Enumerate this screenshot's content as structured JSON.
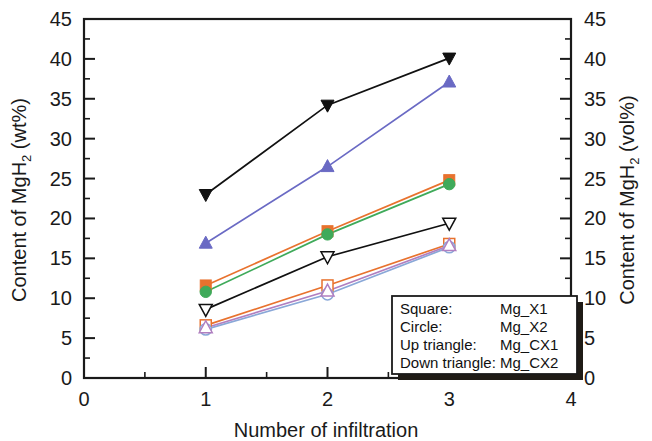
{
  "chart_data": {
    "type": "line",
    "title": "",
    "xlabel": "Number of infiltration",
    "ylabel": "Content of MgH2 (wt%)",
    "ylabel_right": "Content of MgH2 (vol%)",
    "ylabel_main_text": "Content of MgH",
    "ylabel_sub": "2",
    "ylabel_unit": " (wt%)",
    "ylabel_right_main_text": "Content of MgH",
    "ylabel_right_sub": "2",
    "ylabel_right_unit": " (vol%)",
    "x": [
      1,
      2,
      3
    ],
    "xlim": [
      0,
      4
    ],
    "ylim": [
      0,
      45
    ],
    "xticks": [
      0,
      1,
      2,
      3,
      4
    ],
    "yticks": [
      0,
      5,
      10,
      15,
      20,
      25,
      30,
      35,
      40,
      45
    ],
    "yticks_right": [
      0,
      5,
      10,
      15,
      20,
      25,
      30,
      35,
      40,
      45
    ],
    "xtick_labels": [
      "0",
      "1",
      "2",
      "3",
      "4"
    ],
    "ytick_labels": [
      "0",
      "5",
      "10",
      "15",
      "20",
      "25",
      "30",
      "35",
      "40",
      "45"
    ],
    "ytick_labels_right": [
      "0",
      "5",
      "10",
      "15",
      "20",
      "25",
      "30",
      "35",
      "40",
      "45"
    ],
    "grid": false,
    "minor_ticks": true,
    "legend_position": "lower-right",
    "series": [
      {
        "name": "Mg_X1 (wt%)",
        "marker": "square-filled",
        "color": "#e8722e",
        "values": [
          11.6,
          18.4,
          24.8
        ]
      },
      {
        "name": "Mg_X2 (wt%)",
        "marker": "circle-filled",
        "color": "#3faa5a",
        "values": [
          10.8,
          18.0,
          24.3
        ]
      },
      {
        "name": "Mg_CX1 (wt%)",
        "marker": "up-triangle-filled",
        "color": "#6a6ac4",
        "values": [
          16.9,
          26.5,
          37.1
        ]
      },
      {
        "name": "Mg_CX2 (wt%)",
        "marker": "down-triangle-filled",
        "color": "#111111",
        "values": [
          23.0,
          34.2,
          40.1
        ]
      },
      {
        "name": "Mg_X1 (vol%)",
        "marker": "square-open",
        "color": "#e8722e",
        "values": [
          6.6,
          11.6,
          16.8
        ]
      },
      {
        "name": "Mg_X2 (vol%)",
        "marker": "circle-open",
        "color": "#8aa8d8",
        "values": [
          6.1,
          10.5,
          16.4
        ]
      },
      {
        "name": "Mg_CX1 (vol%)",
        "marker": "up-triangle-open",
        "color": "#b07fc0",
        "values": [
          6.3,
          10.9,
          16.6
        ]
      },
      {
        "name": "Mg_CX2 (vol%)",
        "marker": "down-triangle-open",
        "color": "#111111",
        "values": [
          8.6,
          15.2,
          19.4
        ]
      }
    ],
    "legend_entries": [
      {
        "marker_label": "Square:",
        "series_label": "Mg_X1"
      },
      {
        "marker_label": "Circle:",
        "series_label": "Mg_X2"
      },
      {
        "marker_label": "Up triangle:",
        "series_label": "Mg_CX1"
      },
      {
        "marker_label": "Down triangle:",
        "series_label": "Mg_CX2"
      }
    ]
  },
  "colors": {
    "axis": "#1a1a1a",
    "orange": "#e8722e",
    "green": "#3faa5a",
    "purple": "#6a6ac4",
    "black": "#111111",
    "light_blue": "#8aa8d8",
    "light_purple": "#b07fc0",
    "background": "#ffffff"
  }
}
